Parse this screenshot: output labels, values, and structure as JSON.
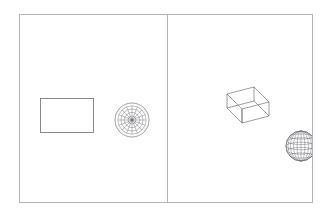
{
  "app": {
    "kind": "cad-wireframe-viewport",
    "background_color": "#ffffff",
    "frame_color": "#b4b4b8",
    "wireframe_color": "#5a5a60"
  },
  "viewport": {
    "frame": {
      "x": 19,
      "y": 14,
      "width": 294,
      "height": 189
    },
    "divider": {
      "x": 147,
      "orientation": "vertical"
    },
    "panes": [
      {
        "id": "pane-left",
        "name": "top-view-pane",
        "projection": "top",
        "objects": [
          {
            "id": "box-top-view",
            "name": "box-rectangle",
            "shape": "rectangle",
            "x": 20,
            "y": 83,
            "width": 53,
            "height": 34
          },
          {
            "id": "sphere-top-view",
            "name": "sphere-polar-circle",
            "shape": "polar-circle",
            "cx": 111,
            "cy": 104,
            "radius": 17,
            "rings": 5,
            "meridians": 16
          }
        ]
      },
      {
        "id": "pane-right",
        "name": "isometric-view-pane",
        "projection": "isometric",
        "objects": [
          {
            "id": "box-iso",
            "name": "box-wireframe",
            "shape": "box",
            "x": 45,
            "y": 72,
            "width": 56,
            "height": 45
          },
          {
            "id": "sphere-iso",
            "name": "sphere-wireframe",
            "shape": "globe",
            "cx": 132,
            "cy": 130,
            "radius": 15,
            "latitudes": 5,
            "longitudes": 8
          }
        ]
      }
    ]
  }
}
